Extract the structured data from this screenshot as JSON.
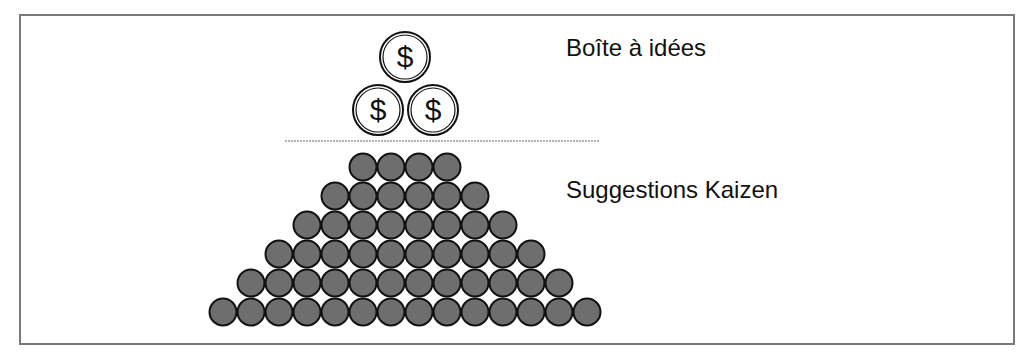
{
  "diagram": {
    "labels": {
      "top": "Boîte à idées",
      "bottom": "Suggestions Kaizen"
    },
    "top_coins": {
      "symbol": "$",
      "count": 3,
      "positions": [
        [
          405,
          57
        ],
        [
          378,
          110
        ],
        [
          433,
          110
        ]
      ],
      "radius": 25
    },
    "pyramid": {
      "row_counts": [
        4,
        6,
        8,
        10,
        12,
        14
      ],
      "row_y": [
        167,
        196,
        225,
        254,
        283,
        312
      ],
      "spacing": 28,
      "center_x": 405,
      "radius": 13.5,
      "fill": "#6e6e6e",
      "stroke": "#111111"
    },
    "divider": {
      "x1": 285,
      "x2": 600,
      "y": 141,
      "color": "#9a9a9a"
    },
    "frame_color": "#7a7a7a"
  }
}
